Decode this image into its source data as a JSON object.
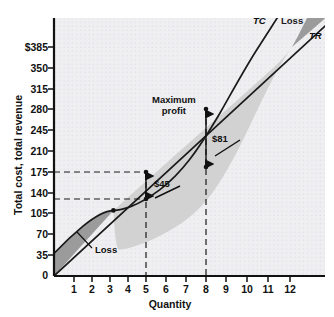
{
  "chart_data": {
    "type": "line",
    "title": "",
    "xlabel": "Quantity",
    "ylabel": "Total cost, total revenue",
    "xlim": [
      0,
      12.8
    ],
    "ylim": [
      0,
      420
    ],
    "xticks": [
      "1",
      "2",
      "3",
      "4",
      "5",
      "6",
      "7",
      "8",
      "9",
      "10",
      "11",
      "12"
    ],
    "xtick_values": [
      1,
      2,
      3,
      4,
      5,
      6,
      7,
      8,
      9,
      10,
      11,
      12
    ],
    "yticks": [
      "0",
      "35",
      "70",
      "105",
      "140",
      "175",
      "210",
      "245",
      "280",
      "315",
      "350",
      "$385"
    ],
    "ytick_values": [
      0,
      35,
      70,
      105,
      140,
      175,
      210,
      245,
      280,
      315,
      350,
      385
    ],
    "grid": true,
    "legend": "inline-curve-labels",
    "series": [
      {
        "name": "TR",
        "label": "TR",
        "type": "line",
        "description": "Total revenue, straight line through origin, slope 35 per unit",
        "x": [
          0,
          1,
          2,
          3,
          4,
          5,
          6,
          7,
          8,
          9,
          10,
          11,
          12
        ],
        "values": [
          0,
          35,
          70,
          105,
          140,
          175,
          210,
          245,
          280,
          315,
          350,
          385,
          420
        ]
      },
      {
        "name": "TC",
        "label": "TC",
        "type": "line",
        "description": "Total cost, S-shaped curve",
        "x": [
          0,
          1,
          2,
          3,
          4,
          5,
          6,
          7,
          8,
          9,
          10,
          11,
          12
        ],
        "values": [
          38,
          62,
          82,
          100,
          118,
          130,
          147,
          172,
          199,
          243,
          300,
          385,
          470
        ]
      }
    ],
    "annotations": [
      {
        "name": "maximum-profit",
        "text": "Maximum profit",
        "x": 7.0,
        "y": 305
      },
      {
        "name": "profit-gap-8",
        "text": "$81",
        "x": 8.35,
        "y": 244,
        "quantity": 8,
        "tr": 280,
        "tc": 199,
        "gap": 81
      },
      {
        "name": "profit-gap-5",
        "text": "$45",
        "x": 5.2,
        "y": 158,
        "quantity": 5,
        "tr": 175,
        "tc": 130,
        "gap": 45
      },
      {
        "name": "loss-low",
        "text": "Loss",
        "x": 3.4,
        "y": 42
      },
      {
        "name": "loss-high",
        "text": "Loss",
        "x": 11.2,
        "y": 418
      }
    ],
    "curve_labels": [
      {
        "name": "tc-label",
        "text": "TC",
        "x": 10.55,
        "y": 418
      },
      {
        "name": "tr-label",
        "text": "TR",
        "x": 12.2,
        "y": 398
      }
    ],
    "reference_lines": [
      {
        "name": "tr-at-5",
        "value": 175,
        "orientation": "horizontal",
        "style": "dashed",
        "to_x": 5
      },
      {
        "name": "tc-at-5",
        "value": 130,
        "orientation": "horizontal",
        "style": "dashed",
        "to_x": 5
      },
      {
        "name": "quantity-5",
        "value": 5,
        "orientation": "vertical",
        "style": "dashed",
        "to_y": 175
      },
      {
        "name": "quantity-8",
        "value": 8,
        "orientation": "vertical",
        "style": "dashed",
        "to_y": 280
      }
    ],
    "breakeven_points": [
      {
        "name": "breakeven-low",
        "quantity": 3.2,
        "value": 112
      },
      {
        "name": "breakeven-high",
        "quantity": 11.0,
        "value": 385
      }
    ],
    "colors": {
      "profit_fill": "#cfcfcf",
      "loss_fill": "#8f8f8f",
      "curve": "#1a1a1a",
      "axis": "#111111",
      "grid": "#d9d9de",
      "plot_background": "#efeff2"
    }
  }
}
